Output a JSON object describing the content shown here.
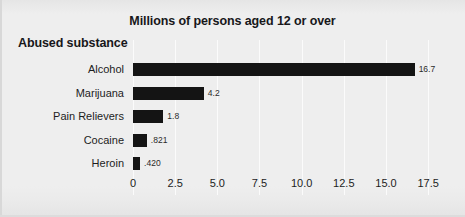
{
  "chart_data": {
    "type": "bar",
    "orientation": "horizontal",
    "title": "Millions of persons aged 12 or over",
    "xlabel": "",
    "ylabel": "Abused substance",
    "categories": [
      "Alcohol",
      "Marijuana",
      "Pain Relievers",
      "Cocaine",
      "Heroin"
    ],
    "values": [
      16.7,
      4.2,
      1.8,
      0.821,
      0.42
    ],
    "value_labels": [
      "16.7",
      "4.2",
      "1.8",
      ".821",
      ".420"
    ],
    "xlim": [
      0,
      18.5
    ],
    "xticks": [
      0,
      2.5,
      5.0,
      7.5,
      10.0,
      12.5,
      15.0,
      17.5
    ],
    "xtick_labels": [
      "0",
      "2.5",
      "5.0",
      "7.5",
      "10.0",
      "12.5",
      "15.0",
      "17.5"
    ],
    "grid": true,
    "legend": false,
    "bar_color": "#141414",
    "background_color": "#eeeeee",
    "gridline_color": "#fbfbfb"
  }
}
